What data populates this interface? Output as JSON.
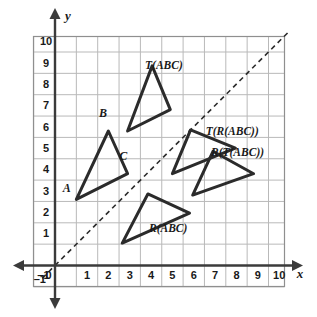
{
  "chart_data": {
    "type": "scatter",
    "title": "",
    "subtitle": "",
    "xlabel": "x",
    "ylabel": "y",
    "xlim": [
      -1,
      11.5
    ],
    "ylim": [
      -1,
      11.5
    ],
    "grid": true,
    "legend": "none",
    "x_ticks": [
      "-1",
      "0",
      "1",
      "2",
      "3",
      "4",
      "5",
      "6",
      "7",
      "8",
      "9",
      "10"
    ],
    "y_ticks": [
      "-1",
      "1",
      "2",
      "3",
      "4",
      "5",
      "6",
      "7",
      "8",
      "9",
      "10"
    ],
    "annotations": [
      {
        "name": "line-y-equals-x",
        "kind": "dashed-line",
        "from": [
          -0.6,
          -0.6
        ],
        "to": [
          11.0,
          11.0
        ]
      }
    ],
    "shapes": [
      {
        "name": "triangle-abc",
        "label": "",
        "label_pos": [
          0,
          0
        ],
        "vertices": [
          [
            1.0,
            3.1
          ],
          [
            2.5,
            6.3
          ],
          [
            3.4,
            4.3
          ]
        ],
        "vertex_labels": [
          {
            "text": "A",
            "pos": [
              0.55,
              3.45
            ]
          },
          {
            "text": "B",
            "pos": [
              2.25,
              6.95
            ]
          },
          {
            "text": "C",
            "pos": [
              3.2,
              4.95
            ]
          }
        ]
      },
      {
        "name": "triangle-t-abc",
        "label": "T(ABC)",
        "label_pos": [
          5.1,
          9.2
        ],
        "vertices": [
          [
            3.4,
            6.3
          ],
          [
            4.55,
            9.35
          ],
          [
            5.4,
            7.3
          ]
        ],
        "vertex_labels": []
      },
      {
        "name": "triangle-r-abc",
        "label": "R(ABC)",
        "label_pos": [
          5.3,
          1.55
        ],
        "vertices": [
          [
            3.15,
            1.05
          ],
          [
            6.3,
            2.45
          ],
          [
            4.35,
            3.35
          ]
        ],
        "vertex_labels": []
      },
      {
        "name": "triangle-t-r-abc",
        "label": "T(R(ABC))",
        "label_pos": [
          8.3,
          6.1
        ],
        "vertices": [
          [
            5.5,
            4.3
          ],
          [
            6.35,
            6.35
          ],
          [
            8.45,
            5.5
          ]
        ],
        "vertex_labels": []
      },
      {
        "name": "triangle-r-t-abc",
        "label": "R(T(ABC))",
        "label_pos": [
          8.55,
          5.15
        ],
        "vertices": [
          [
            6.45,
            3.3
          ],
          [
            9.3,
            4.3
          ],
          [
            7.4,
            5.35
          ]
        ],
        "vertex_labels": []
      }
    ],
    "colors": {
      "grid": "#b9b9b9",
      "axis": "#3b3b3b",
      "shape_stroke": "#2b2b2b",
      "dashed": "#2b2b2b",
      "background": "#ffffff"
    }
  }
}
